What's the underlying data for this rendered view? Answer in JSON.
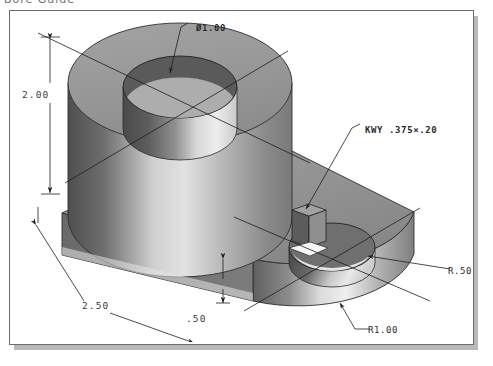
{
  "document": {
    "clipped_header_text": "Bore Guide",
    "figure_title": "Isometric shaded pictorial of a two-hole bearing block"
  },
  "frame": {
    "border_color": "#6d6d6d",
    "shadow_color": "#b9b9b9",
    "background": "#ffffff"
  },
  "palette": {
    "face_top": "#9a9a9a",
    "face_front_dark": "#6e6e6e",
    "face_side": "#858585",
    "highlight": "#e8e8e8",
    "bore_shadow": "#4c4c4c",
    "line": "#232323",
    "text": "#2b2b2b"
  },
  "annotations": [
    {
      "name": "diameter-callout",
      "label": "Ø1.00",
      "x": 186,
      "y": 12
    },
    {
      "name": "keyway-callout",
      "label": "KWY .375×.20",
      "x": 355,
      "y": 114
    },
    {
      "name": "radius-r50",
      "label": "R.50",
      "x": 446,
      "y": 259
    },
    {
      "name": "radius-r100",
      "label": "R1.00",
      "x": 366,
      "y": 320
    }
  ],
  "dimensions": [
    {
      "name": "height-dimension",
      "label": "2.00",
      "x": 22,
      "y": 85
    },
    {
      "name": "length-dimension",
      "label": "2.50",
      "x": 82,
      "y": 296
    },
    {
      "name": "thickness-dimension",
      "label": ".50",
      "x": 186,
      "y": 309
    }
  ],
  "geometry": {
    "big_boss": {
      "hole_diameter": "1.00",
      "boss_height": "2.00"
    },
    "base_plate": {
      "length": "2.50",
      "thickness": ".50",
      "end_radius": "1.00"
    },
    "small_hole": {
      "radius": ".50",
      "keyway_width": ".375",
      "keyway_depth": ".20"
    }
  }
}
